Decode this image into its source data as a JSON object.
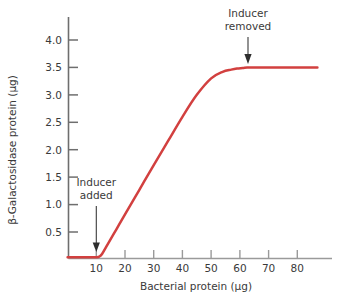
{
  "chart_data": {
    "type": "line",
    "title": "",
    "xlabel": "Bacterial protein (µg)",
    "ylabel": "β-Galactosidase protein (µg)",
    "xlim": [
      0,
      87
    ],
    "ylim": [
      0,
      4.35
    ],
    "grid": false,
    "legend": "none",
    "xticks": [
      10,
      20,
      30,
      40,
      50,
      60,
      70,
      80
    ],
    "xticklabels": [
      "10",
      "20",
      "30",
      "40",
      "50",
      "60",
      "70",
      "80"
    ],
    "yticks": [
      0.5,
      1.0,
      1.5,
      2.0,
      2.5,
      3.0,
      3.5,
      4.0
    ],
    "yticklabels": [
      "0.5",
      "1.0",
      "1.5",
      "2.0",
      "2.5",
      "3.0",
      "3.5",
      "4.0"
    ],
    "series": [
      {
        "name": "β-Galactosidase accumulation",
        "color": "#d2403f",
        "x": [
          0,
          4,
          8,
          10,
          11,
          12,
          14,
          17,
          20,
          25,
          30,
          35,
          40,
          45,
          50,
          54,
          57,
          59,
          61,
          62.5,
          64,
          66,
          70,
          75,
          80,
          87
        ],
        "y": [
          0.04,
          0.04,
          0.04,
          0.04,
          0.05,
          0.1,
          0.28,
          0.55,
          0.82,
          1.27,
          1.72,
          2.16,
          2.6,
          3.0,
          3.3,
          3.42,
          3.46,
          3.48,
          3.49,
          3.5,
          3.5,
          3.5,
          3.5,
          3.5,
          3.5,
          3.5
        ]
      }
    ],
    "annotations": [
      {
        "id": "inducer-added",
        "text_line1": "Inducer",
        "text_line2": "added",
        "target_x": 10,
        "target_y": 0.05,
        "arrow": "down"
      },
      {
        "id": "inducer-removed",
        "text_line1": "Inducer",
        "text_line2": "removed",
        "target_x": 63,
        "target_y": 3.5,
        "arrow": "down"
      }
    ]
  },
  "colors": {
    "curve": "#d2403f",
    "axis": "#6e6e6e",
    "text": "#3a3a3a",
    "background": "#ffffff"
  }
}
